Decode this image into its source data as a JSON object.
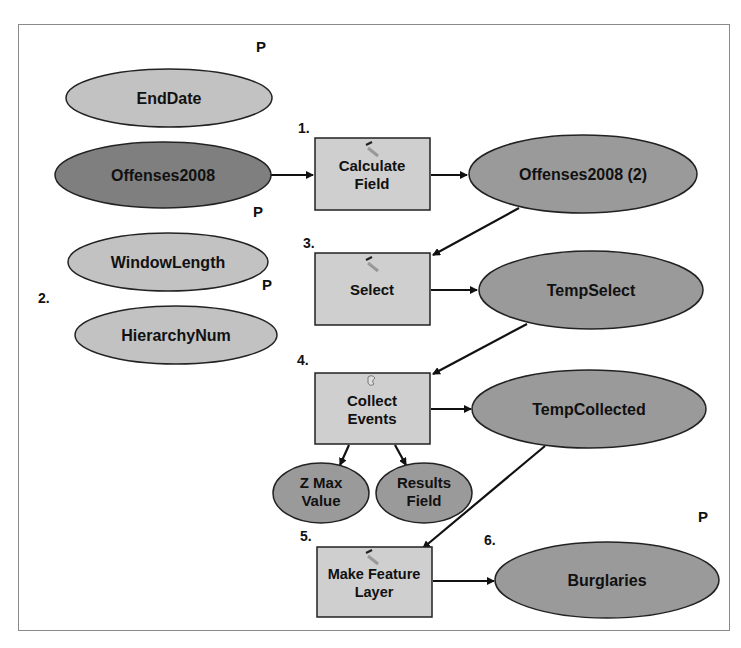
{
  "colors": {
    "input_variable": "#c2c2c2",
    "input_data": "#7f7f7f",
    "derived_data": "#9a9a9a",
    "tool": "#cfcfcf",
    "stroke": "#222222",
    "frame": "#8a8a8a"
  },
  "nodes": {
    "end_date": {
      "label": "EndDate",
      "type": "variable"
    },
    "offenses2008": {
      "label": "Offenses2008",
      "type": "input-data"
    },
    "window_length": {
      "label": "WindowLength",
      "type": "variable"
    },
    "hierarchy_num": {
      "label": "HierarchyNum",
      "type": "variable"
    },
    "calculate_field": {
      "line1": "Calculate",
      "line2": "Field",
      "type": "tool",
      "icon": "hammer-icon"
    },
    "offenses2008_2": {
      "label": "Offenses2008 (2)",
      "type": "derived-data"
    },
    "select": {
      "label": "Select",
      "type": "tool",
      "icon": "hammer-icon"
    },
    "temp_select": {
      "label": "TempSelect",
      "type": "derived-data"
    },
    "collect_events": {
      "line1": "Collect",
      "line2": "Events",
      "type": "tool",
      "icon": "script-icon"
    },
    "temp_collected": {
      "label": "TempCollected",
      "type": "derived-data"
    },
    "z_max_value": {
      "line1": "Z Max",
      "line2": "Value",
      "type": "derived-data"
    },
    "results_field": {
      "line1": "Results",
      "line2": "Field",
      "type": "derived-data"
    },
    "make_feature_layer": {
      "line1": "Make Feature",
      "line2": "Layer",
      "type": "tool",
      "icon": "hammer-icon"
    },
    "burglaries": {
      "label": "Burglaries",
      "type": "derived-data"
    }
  },
  "step_labels": {
    "s1": "1.",
    "s2": "2.",
    "s3": "3.",
    "s4": "4.",
    "s5": "5.",
    "s6": "6."
  },
  "parameter_markers": {
    "p_end_date": "P",
    "p_offenses": "P",
    "p_window_length": "P",
    "p_burglaries": "P"
  },
  "edges": [
    {
      "from": "Offenses2008",
      "to": "Calculate Field"
    },
    {
      "from": "Calculate Field",
      "to": "Offenses2008 (2)"
    },
    {
      "from": "Offenses2008 (2)",
      "to": "Select"
    },
    {
      "from": "Select",
      "to": "TempSelect"
    },
    {
      "from": "TempSelect",
      "to": "Collect Events"
    },
    {
      "from": "Collect Events",
      "to": "TempCollected"
    },
    {
      "from": "Collect Events",
      "to": "Z Max Value"
    },
    {
      "from": "Collect Events",
      "to": "Results Field"
    },
    {
      "from": "TempCollected",
      "to": "Make Feature Layer"
    },
    {
      "from": "Make Feature Layer",
      "to": "Burglaries"
    }
  ]
}
